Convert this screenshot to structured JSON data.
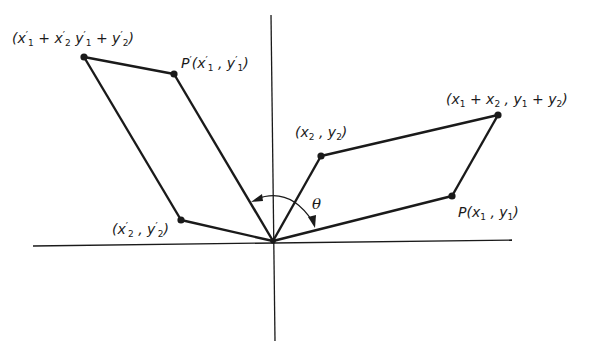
{
  "diagram": {
    "type": "vector-rotation-parallelogram",
    "colors": {
      "stroke": "#1a1a1a",
      "background": "#ffffff"
    },
    "axes": {
      "x_axis": {
        "x1": 33,
        "y1": 246,
        "x2": 512,
        "y2": 240
      },
      "y_axis": {
        "x1": 271,
        "y1": 15,
        "x2": 275,
        "y2": 341
      }
    },
    "origin": {
      "x": 273,
      "y": 241
    },
    "points": [
      {
        "id": "P",
        "x": 452,
        "y": 196,
        "label": "P(x₁ , y₁)"
      },
      {
        "id": "Q",
        "x": 321,
        "y": 156,
        "label": "(x₂ , y₂)"
      },
      {
        "id": "S",
        "x": 498,
        "y": 115,
        "label": "(x₁ + x₂ , y₁ + y₂)"
      },
      {
        "id": "P_prime",
        "x": 174,
        "y": 74,
        "label": "P′(x′₁ , y′₁)"
      },
      {
        "id": "Q_prime",
        "x": 181,
        "y": 220,
        "label": "(x′₂ , y′₂)"
      },
      {
        "id": "S_prime",
        "x": 84,
        "y": 57,
        "label": "(x′₁ + x′₂ y′₁ + y′₂)"
      }
    ],
    "angle_label": "θ"
  },
  "labels": {
    "s_prime": "(x′₁ + x′₂ y′₁ + y′₂)",
    "p_prime": "P′(x′₁ , y′₁)",
    "s": "(x₁ + x₂ , y₁ + y₂)",
    "q": "(x₂ , y₂)",
    "p": "P(x₁ , y₁)",
    "q_prime": "(x′₂ , y′₂)",
    "theta": "θ"
  }
}
